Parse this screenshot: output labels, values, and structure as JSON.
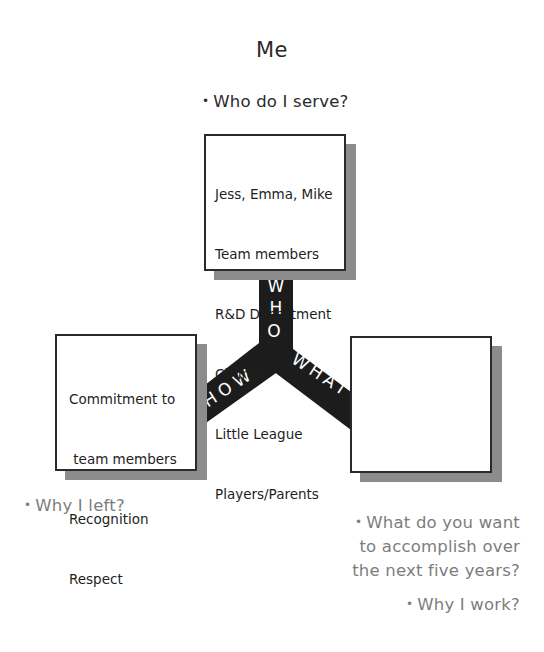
{
  "title": "Me",
  "questions": {
    "who_serve": "Who do I serve?",
    "why_left": "Why I left?",
    "accomplish": [
      "What do you want",
      "to accomplish over",
      "the next five years?"
    ],
    "why_work": "Why I work?"
  },
  "bullet": "•",
  "boxes": {
    "who": {
      "label": "WHO",
      "lines": [
        "Jess, Emma, Mike",
        "Team members",
        "R&D Department",
        "Church",
        "Little League",
        "Players/Parents"
      ]
    },
    "how": {
      "label": "HOW",
      "lines": [
        "Commitment to",
        " team members",
        "Recognition",
        "Respect"
      ]
    },
    "what": {
      "label": "WHAT",
      "lines": []
    }
  },
  "colors": {
    "band": "#1c1c1c",
    "shadow": "#8c8c8c",
    "gray_text": "#7d7d7d",
    "border": "#2a2a2a"
  }
}
